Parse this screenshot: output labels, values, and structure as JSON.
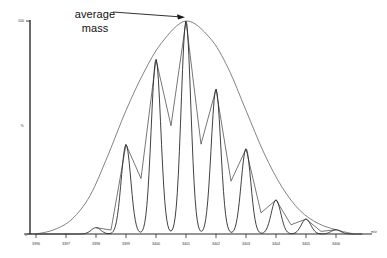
{
  "figure": {
    "background_color": "#ffffff",
    "line_color": "#2b2b2b",
    "envelope_color": "#5a5a5a"
  },
  "annotation": {
    "line1": "average",
    "line2": "mass",
    "arrow": "arrow-pointing-right-to-envelope-apex"
  },
  "axes": {
    "y_axis_top_label": "100",
    "y_axis_bottom_label": "0",
    "y_axis_title": "%",
    "x_axis_unit": "m/z",
    "x_ticks": [
      "3396",
      "3397",
      "3398",
      "3399",
      "3400",
      "3401",
      "3402",
      "3403",
      "3404",
      "3405",
      "3406"
    ]
  },
  "chart_data": {
    "type": "line",
    "title": "",
    "subtitle": "",
    "xlabel": "m/z",
    "ylabel": "%",
    "xlim": [
      3395.6,
      3406.8
    ],
    "ylim": [
      0,
      100
    ],
    "grid": false,
    "legend": "none",
    "annotations": [
      {
        "text": "average mass",
        "points_to_x": 3401.0,
        "points_to_y": 100
      }
    ],
    "x": [
      3396,
      3397,
      3398,
      3399,
      3400,
      3401,
      3402,
      3403,
      3404,
      3405,
      3406
    ],
    "series": [
      {
        "name": "isotope peaks",
        "type": "peaks",
        "x": [
          3398,
          3399,
          3400,
          3401,
          3402,
          3403,
          3404,
          3405,
          3406
        ],
        "values": [
          3,
          42,
          82,
          100,
          68,
          40,
          16,
          7,
          2
        ]
      },
      {
        "name": "peak-connecting line",
        "type": "line",
        "x": [
          3398,
          3399,
          3400,
          3401,
          3402,
          3403,
          3404,
          3405,
          3406
        ],
        "values": [
          3,
          42,
          82,
          100,
          68,
          40,
          16,
          7,
          2
        ]
      },
      {
        "name": "average mass envelope",
        "type": "area",
        "x": [
          3396.0,
          3396.6,
          3397.2,
          3397.8,
          3398.4,
          3399.0,
          3399.6,
          3400.2,
          3401.0,
          3401.8,
          3402.4,
          3403.0,
          3403.6,
          3404.2,
          3404.8,
          3405.4,
          3406.0,
          3406.6
        ],
        "values": [
          0,
          2,
          7,
          18,
          37,
          58,
          76,
          90,
          100,
          92,
          78,
          58,
          38,
          22,
          11,
          5,
          2,
          0
        ]
      }
    ]
  }
}
